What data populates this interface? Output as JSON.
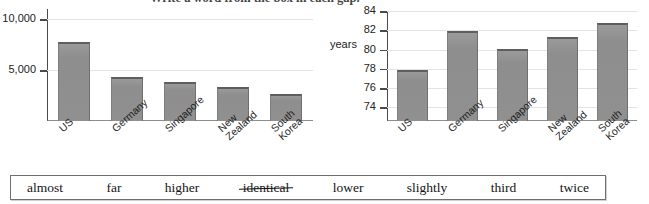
{
  "instruction": "Write a word from the box in each gap.",
  "chart_data": [
    {
      "type": "bar",
      "id": "health-spending",
      "title": "",
      "xlabel": "",
      "ylabel": "",
      "categories": [
        "US",
        "Germany",
        "Singapore",
        "New Zealand",
        "South Korea"
      ],
      "values": [
        7800,
        4300,
        3800,
        3300,
        2700
      ],
      "ytick_labels": [
        "10,000",
        "5,000"
      ],
      "ytick_values": [
        10000,
        5000
      ],
      "ylim": [
        0,
        11000
      ],
      "grid": true,
      "legend": "none"
    },
    {
      "type": "bar",
      "id": "life-expectancy",
      "title": "",
      "xlabel": "",
      "ylabel": "years",
      "categories": [
        "US",
        "Germany",
        "Singapore",
        "New Zealand",
        "South Korea"
      ],
      "values": [
        77.9,
        81.9,
        80.1,
        81.3,
        82.8
      ],
      "ytick_labels": [
        "84",
        "82",
        "80",
        "78",
        "76",
        "74"
      ],
      "ytick_values": [
        84,
        82,
        80,
        78,
        76,
        74
      ],
      "ylim": [
        72.6,
        84
      ],
      "grid": true,
      "legend": "none"
    }
  ],
  "word_bank": {
    "words": [
      {
        "label": "almost",
        "struck": false
      },
      {
        "label": "far",
        "struck": false
      },
      {
        "label": "higher",
        "struck": false
      },
      {
        "label": "identical",
        "struck": true
      },
      {
        "label": "lower",
        "struck": false
      },
      {
        "label": "slightly",
        "struck": false
      },
      {
        "label": "third",
        "struck": false
      },
      {
        "label": "twice",
        "struck": false
      }
    ]
  },
  "colors": {
    "bar_fill": "#909090",
    "bar_top_edge": "#5e5e5e",
    "axis": "#4a4a4a",
    "gridline": "#e3e3e3",
    "text": "#1a1a1a"
  }
}
